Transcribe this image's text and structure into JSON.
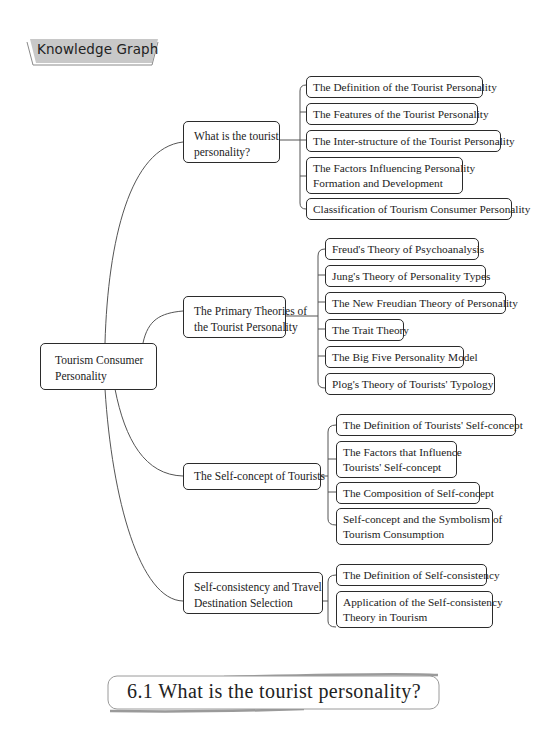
{
  "banner": {
    "label": "Knowledge Graph",
    "fill": "#c8c8c8"
  },
  "mindmap": {
    "root": {
      "lines": [
        "Tourism Consumer",
        "Personality"
      ]
    },
    "branches": [
      {
        "lines": [
          "What is the tourist",
          "personality?"
        ],
        "children": [
          {
            "lines": [
              "The Definition of the Tourist Personality"
            ]
          },
          {
            "lines": [
              "The Features of the Tourist Personality"
            ]
          },
          {
            "lines": [
              "The Inter-structure of the Tourist Personality"
            ]
          },
          {
            "lines": [
              "The Factors Influencing Personality",
              "Formation and Development"
            ]
          },
          {
            "lines": [
              "Classification of Tourism Consumer Personality"
            ]
          }
        ]
      },
      {
        "lines": [
          "The Primary Theories of",
          "the Tourist Personality"
        ],
        "children": [
          {
            "lines": [
              "Freud's  Theory of Psychoanalysis"
            ]
          },
          {
            "lines": [
              "Jung's  Theory of Personality Types"
            ]
          },
          {
            "lines": [
              "The New Freudian Theory of Personality"
            ]
          },
          {
            "lines": [
              "The Trait Theory"
            ]
          },
          {
            "lines": [
              "The Big Five Personality Model"
            ]
          },
          {
            "lines": [
              "Plog's  Theory of Tourists'  Typology"
            ]
          }
        ]
      },
      {
        "lines": [
          "The Self-concept of Tourists"
        ],
        "children": [
          {
            "lines": [
              "The Definition of Tourists'  Self-concept"
            ]
          },
          {
            "lines": [
              "The Factors that Influence",
              "Tourists'  Self-concept"
            ]
          },
          {
            "lines": [
              "The Composition of Self-concept"
            ]
          },
          {
            "lines": [
              "Self-concept and the Symbolism of",
              "Tourism Consumption"
            ]
          }
        ]
      },
      {
        "lines": [
          "Self-consistency and Travel",
          "Destination Selection"
        ],
        "children": [
          {
            "lines": [
              "The Definition of Self-consistency"
            ]
          },
          {
            "lines": [
              "Application of the Self-consistency",
              "Theory in Tourism"
            ]
          }
        ]
      }
    ]
  },
  "section": {
    "heading": "6.1 What is the tourist personality?"
  }
}
